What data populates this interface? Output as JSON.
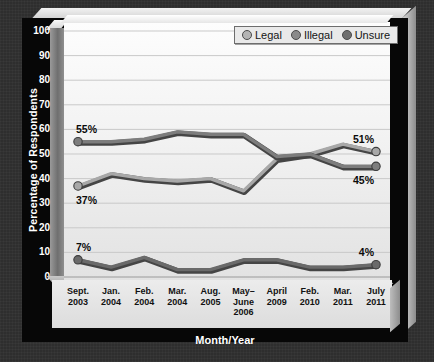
{
  "chart_data": {
    "type": "line",
    "title": "",
    "xlabel": "Month/Year",
    "ylabel": "Percentage of Respondents",
    "ylim": [
      0,
      100
    ],
    "ytick_step": 10,
    "yticks": [
      100,
      90,
      80,
      70,
      60,
      50,
      40,
      30,
      20,
      10,
      0
    ],
    "grid": true,
    "legend_position": "top-right",
    "categories": [
      "Sept. 2003",
      "Jan. 2004",
      "Feb. 2004",
      "Mar. 2004",
      "Aug. 2005",
      "May–June 2006",
      "April 2009",
      "Feb. 2010",
      "Mar. 2011",
      "July 2011"
    ],
    "category_lines": [
      [
        "Sept.",
        "2003"
      ],
      [
        "Jan.",
        "2004"
      ],
      [
        "Feb.",
        "2004"
      ],
      [
        "Mar.",
        "2004"
      ],
      [
        "Aug.",
        "2005"
      ],
      [
        "May–",
        "June",
        "2006"
      ],
      [
        "April",
        "2009"
      ],
      [
        "Feb.",
        "2010"
      ],
      [
        "Mar.",
        "2011"
      ],
      [
        "July",
        "2011"
      ]
    ],
    "series": [
      {
        "name": "Legal",
        "color": "#a8a8a8",
        "values": [
          37,
          42,
          40,
          39,
          40,
          35,
          48,
          50,
          54,
          51
        ]
      },
      {
        "name": "Illegal",
        "color": "#7d7d7d",
        "values": [
          55,
          55,
          56,
          59,
          58,
          58,
          49,
          50,
          45,
          45
        ]
      },
      {
        "name": "Unsure",
        "color": "#6a6a6a",
        "values": [
          7,
          4,
          8,
          3,
          3,
          7,
          7,
          4,
          4,
          5
        ]
      }
    ],
    "annotations": [
      {
        "text": "55%",
        "series": "Illegal",
        "position": "left"
      },
      {
        "text": "37%",
        "series": "Legal",
        "position": "left"
      },
      {
        "text": "7%",
        "series": "Unsure",
        "position": "left"
      },
      {
        "text": "51%",
        "series": "Legal",
        "position": "right"
      },
      {
        "text": "45%",
        "series": "Illegal",
        "position": "right"
      },
      {
        "text": "4%",
        "series": "Unsure",
        "position": "right"
      }
    ]
  },
  "legend": {
    "items": [
      {
        "label": "Legal",
        "color": "#b4b4b4"
      },
      {
        "label": "Illegal",
        "color": "#8a8a8a"
      },
      {
        "label": "Unsure",
        "color": "#6e6e6e"
      }
    ]
  },
  "axis": {
    "y_title": "Percentage of Respondents",
    "x_title": "Month/Year"
  }
}
